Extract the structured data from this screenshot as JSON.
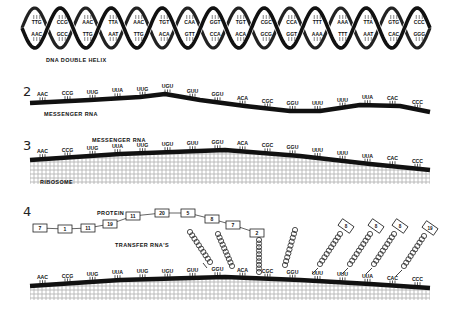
{
  "colors": {
    "ink": "#111111",
    "background": "#ffffff",
    "ribosome_dots": "#888888"
  },
  "section1": {
    "number": "",
    "caption": "DNA DOUBLE HELIX",
    "top_strand": [
      "TTG",
      "CCG",
      "AAC",
      "TTA",
      "AAC",
      "TGT",
      "CAA",
      "GGT",
      "TGT",
      "CGC",
      "CCA",
      "TTT",
      "AAA",
      "TTA",
      "GTG",
      "CCC"
    ],
    "bottom_strand": [
      "AAC",
      "GCC",
      "TTG",
      "AAT",
      "TTG",
      "ACA",
      "GTT",
      "CCA",
      "ACA",
      "GCG",
      "GGT",
      "AAA",
      "TTT",
      "AAT",
      "CAC",
      "GGG"
    ]
  },
  "section2": {
    "number": "2",
    "caption": "MESSENGER RNA",
    "codons": [
      "AAC",
      "CCG",
      "UUG",
      "UUA",
      "UUG",
      "UGU",
      "GUU",
      "GGU",
      "ACA",
      "CGC",
      "GGU",
      "UUU",
      "UUU",
      "UUA",
      "CAC",
      "CCC"
    ]
  },
  "section3": {
    "number": "3",
    "caption_top": "MESSENGER RNA",
    "caption_bottom": "RIBOSOME",
    "codons": [
      "AAC",
      "CCG",
      "UUG",
      "UUA",
      "UUG",
      "UGU",
      "GUU",
      "GGU",
      "ACA",
      "CGC",
      "GGU",
      "UUU",
      "UUU",
      "UUA",
      "CAC",
      "CCC"
    ]
  },
  "section4": {
    "number": "4",
    "protein_label": "PROTEIN",
    "trna_label": "TRANSFER RNA'S",
    "protein_chain": [
      "7",
      "1",
      "11",
      "19",
      "11",
      "20",
      "5",
      "8",
      "7",
      "2"
    ],
    "incoming_trnas": [
      "8",
      "8",
      "8",
      "19"
    ],
    "codons": [
      "AAC",
      "CCG",
      "UUG",
      "UUA",
      "UUG",
      "UGU",
      "GUU",
      "GGU",
      "ACA",
      "CGC",
      "GGU",
      "UUU",
      "UUU",
      "UUA",
      "CAC",
      "CCC"
    ]
  }
}
